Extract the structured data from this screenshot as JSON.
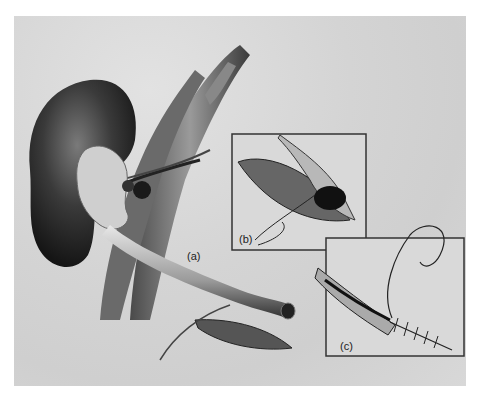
{
  "figure": {
    "labels": {
      "a": "(a)",
      "b": "(b)",
      "c": "(c)"
    },
    "colors": {
      "background": "#ffffff",
      "panel": "#d6d6d6",
      "organ_dark": "#2a2a2a",
      "organ_mid": "#777777",
      "inset_border": "#333333"
    }
  }
}
